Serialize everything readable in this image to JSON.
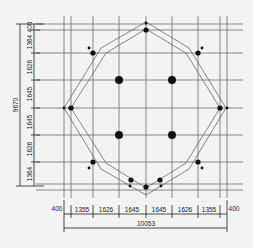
{
  "drawing": {
    "type": "octagonal floor plan with column grid",
    "bottom_dimensions": {
      "segments": [
        "400",
        "1355",
        "1626",
        "1645",
        "1645",
        "1626",
        "1355",
        "400"
      ],
      "total": "10053"
    },
    "left_dimensions": {
      "segments": [
        "400",
        "1364",
        "1626",
        "1645",
        "1645",
        "1626",
        "1364"
      ],
      "total": "9670"
    },
    "grid": {
      "x": [
        64,
        71,
        93,
        119,
        146,
        172,
        198,
        220,
        227
      ],
      "y": [
        24,
        30,
        53,
        80,
        108,
        135,
        162,
        184,
        190
      ]
    },
    "colors": {
      "background": "#f3f3f3",
      "line": "#222222",
      "grid": "#6a6a6a"
    }
  }
}
